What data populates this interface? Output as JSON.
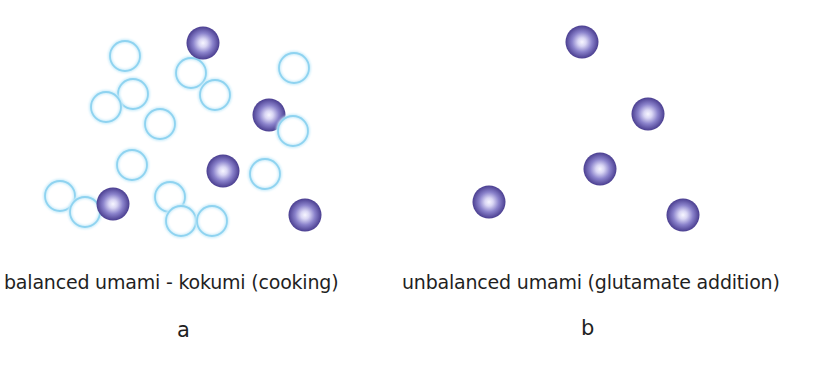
{
  "colors": {
    "kokumi_stroke": "#8fd3f0",
    "kokumi_glow": "#c9ecfa",
    "umami_edge": "#4b3f93",
    "umami_mid": "#7f77c4",
    "umami_center": "#f4f3ff",
    "text": "#1f1f1f"
  },
  "panels": [
    {
      "id": "a",
      "letter": "a",
      "caption": "balanced umami - kokumi (cooking)",
      "kokumi_molecules": [
        {
          "cx": 125,
          "cy": 56
        },
        {
          "cx": 191,
          "cy": 73
        },
        {
          "cx": 215,
          "cy": 95
        },
        {
          "cx": 294,
          "cy": 68
        },
        {
          "cx": 133,
          "cy": 94
        },
        {
          "cx": 106,
          "cy": 107
        },
        {
          "cx": 160,
          "cy": 124
        },
        {
          "cx": 293,
          "cy": 131
        },
        {
          "cx": 132,
          "cy": 165
        },
        {
          "cx": 265,
          "cy": 174
        },
        {
          "cx": 60,
          "cy": 196
        },
        {
          "cx": 85,
          "cy": 212
        },
        {
          "cx": 170,
          "cy": 197
        },
        {
          "cx": 181,
          "cy": 221
        },
        {
          "cx": 212,
          "cy": 221
        }
      ],
      "umami_molecules": [
        {
          "cx": 203,
          "cy": 43
        },
        {
          "cx": 269,
          "cy": 115
        },
        {
          "cx": 223,
          "cy": 171
        },
        {
          "cx": 113,
          "cy": 204
        },
        {
          "cx": 305,
          "cy": 215
        }
      ]
    },
    {
      "id": "b",
      "letter": "b",
      "caption": "unbalanced umami (glutamate addition)",
      "kokumi_molecules": [],
      "umami_molecules": [
        {
          "cx": 582,
          "cy": 42
        },
        {
          "cx": 648,
          "cy": 114
        },
        {
          "cx": 600,
          "cy": 169
        },
        {
          "cx": 489,
          "cy": 202
        },
        {
          "cx": 683,
          "cy": 215
        }
      ]
    }
  ]
}
